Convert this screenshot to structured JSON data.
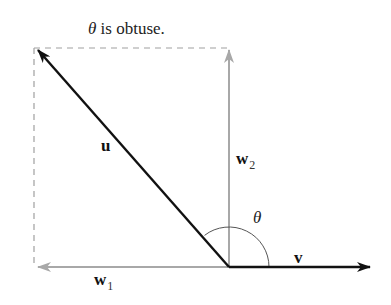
{
  "diagram": {
    "title_symbol": "θ",
    "title_text": " is obtuse.",
    "labels": {
      "u": "u",
      "w2_main": "w",
      "w2_sub": "2",
      "w1_main": "w",
      "w1_sub": "1",
      "v": "v",
      "theta": "θ"
    },
    "colors": {
      "primary_vector": "#111111",
      "projection_vector": "#a8a8a8",
      "dashed_guide": "#a0a0a0",
      "arc": "#555555"
    },
    "geometry": {
      "origin": [
        229,
        267
      ],
      "u_tip": [
        36,
        48
      ],
      "v_tip": [
        371,
        267
      ],
      "w1_tip": [
        36,
        267
      ],
      "w2_tip": [
        229,
        48
      ]
    }
  }
}
